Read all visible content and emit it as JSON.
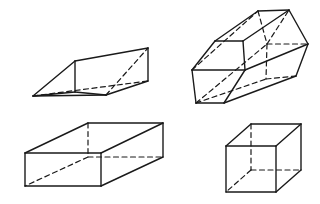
{
  "figure": {
    "background_color": "#ffffff",
    "stroke_color": "#1a1a1a",
    "visible_stroke_width": 1.4,
    "hidden_stroke_width": 1.2,
    "hidden_dash_pattern": "5,3.5",
    "width": 320,
    "height": 204,
    "shapes": [
      {
        "name": "triangular-prism",
        "label": "Triangular Prism",
        "position": "upper-left",
        "visible_edges": [
          "33,96 75,61",
          "75,61 148,48",
          "148,48 148,81",
          "148,81 106,95",
          "106,95 33,96",
          "75,61 75,92",
          "33,96 75,92",
          "75,92 106,95"
        ],
        "hidden_edges": [
          "33,96 148,81",
          "106,95 148,48"
        ]
      },
      {
        "name": "hexagonal-prism",
        "label": "Hexagonal Prism",
        "position": "upper-right",
        "visible_edges": [
          "192,70 215,41",
          "215,41 243,41",
          "243,41 245,70",
          "245,70 224,103",
          "224,103 196,103",
          "196,103 192,70",
          "215,41 258,11",
          "243,41 289,10",
          "245,70 308,44",
          "224,103 296,76",
          "258,11 289,10",
          "289,10 308,44",
          "308,44 296,76",
          "192,70 245,70"
        ],
        "hidden_edges": [
          "196,103 266,79",
          "266,79 296,76",
          "258,11 267,44",
          "267,44 289,10",
          "267,44 308,44",
          "267,44 266,79",
          "192,70 258,11",
          "196,103 267,44"
        ]
      },
      {
        "name": "rectangular-prism",
        "label": "Rectangular Prism",
        "position": "lower-left",
        "visible_edges": [
          "25,153 88,123",
          "88,123 163,123",
          "163,123 163,157",
          "163,157 101,186",
          "101,186 25,186",
          "25,186 25,153",
          "25,153 101,153",
          "101,153 101,186",
          "101,153 163,123"
        ],
        "hidden_edges": [
          "88,123 88,157",
          "88,157 25,186",
          "88,157 163,157"
        ]
      },
      {
        "name": "cube",
        "label": "Cube",
        "position": "lower-right",
        "visible_edges": [
          "226,146 251,124",
          "251,124 301,124",
          "301,124 301,170",
          "301,170 276,192",
          "276,192 226,192",
          "226,192 226,146",
          "226,146 276,146",
          "276,146 276,192",
          "276,146 301,124"
        ],
        "hidden_edges": [
          "251,124 251,170",
          "251,170 226,192",
          "251,170 301,170"
        ]
      }
    ]
  }
}
